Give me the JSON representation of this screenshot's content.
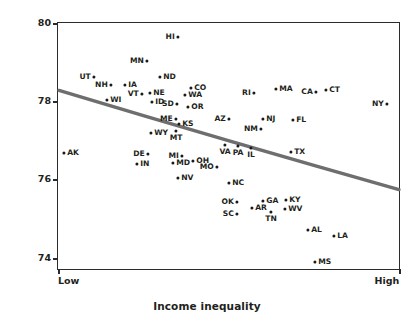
{
  "chart_data": {
    "type": "scatter",
    "title": "",
    "xlabel": "Income inequality",
    "ylabel": "Life expectancy (years)",
    "x_tick_labels": [
      "Low",
      "High"
    ],
    "y_tick_labels": [
      "74",
      "76",
      "78",
      "80"
    ],
    "ylim": [
      73.4,
      80.2
    ],
    "grid": false,
    "legend": "none",
    "point_color": "#1a1a1a",
    "trend_line_color": "#6e6e6e",
    "trend_line": {
      "description": "downward sloping fitted trend line from low-inequality/high-life-expectancy to high-inequality/low-life-expectancy",
      "x_start_px": 58,
      "y_start_px": 90,
      "x_end_px": 400,
      "y_end_px": 190,
      "control_x_px": 230,
      "control_y_px": 142
    },
    "points": [
      {
        "label": "HI",
        "px": 177,
        "py": 36,
        "life_expectancy": 79.65,
        "label_side": "left"
      },
      {
        "label": "MN",
        "px": 146,
        "py": 60,
        "life_expectancy": 79.05,
        "label_side": "left"
      },
      {
        "label": "UT",
        "px": 93,
        "py": 76,
        "life_expectancy": 78.65,
        "label_side": "left"
      },
      {
        "label": "ND",
        "px": 159,
        "py": 76,
        "life_expectancy": 78.65,
        "label_side": "right"
      },
      {
        "label": "NH",
        "px": 110,
        "py": 84,
        "life_expectancy": 78.45,
        "label_side": "left"
      },
      {
        "label": "IA",
        "px": 124,
        "py": 84,
        "life_expectancy": 78.45,
        "label_side": "right"
      },
      {
        "label": "CO",
        "px": 190,
        "py": 87,
        "life_expectancy": 78.37,
        "label_side": "right"
      },
      {
        "label": "MA",
        "px": 275,
        "py": 88,
        "life_expectancy": 78.35,
        "label_side": "right"
      },
      {
        "label": "CA",
        "px": 315,
        "py": 91,
        "life_expectancy": 78.27,
        "label_side": "left"
      },
      {
        "label": "CT",
        "px": 325,
        "py": 89,
        "life_expectancy": 78.32,
        "label_side": "right"
      },
      {
        "label": "VT",
        "px": 141,
        "py": 93,
        "life_expectancy": 78.22,
        "label_side": "left"
      },
      {
        "label": "NE",
        "px": 149,
        "py": 92,
        "life_expectancy": 78.25,
        "label_side": "right"
      },
      {
        "label": "WA",
        "px": 184,
        "py": 94,
        "life_expectancy": 78.2,
        "label_side": "right"
      },
      {
        "label": "RI",
        "px": 253,
        "py": 92,
        "life_expectancy": 78.25,
        "label_side": "left"
      },
      {
        "label": "WI",
        "px": 106,
        "py": 99,
        "life_expectancy": 78.07,
        "label_side": "right"
      },
      {
        "label": "ID",
        "px": 151,
        "py": 101,
        "life_expectancy": 78.02,
        "label_side": "right"
      },
      {
        "label": "SD",
        "px": 176,
        "py": 103,
        "life_expectancy": 77.97,
        "label_side": "left"
      },
      {
        "label": "NY",
        "px": 386,
        "py": 103,
        "life_expectancy": 77.97,
        "label_side": "left"
      },
      {
        "label": "OR",
        "px": 187,
        "py": 106,
        "life_expectancy": 77.9,
        "label_side": "right"
      },
      {
        "label": "ME",
        "px": 175,
        "py": 118,
        "life_expectancy": 77.6,
        "label_side": "left"
      },
      {
        "label": "AZ",
        "px": 228,
        "py": 118,
        "life_expectancy": 77.6,
        "label_side": "left"
      },
      {
        "label": "NJ",
        "px": 262,
        "py": 118,
        "life_expectancy": 77.6,
        "label_side": "right"
      },
      {
        "label": "FL",
        "px": 292,
        "py": 119,
        "life_expectancy": 77.57,
        "label_side": "right"
      },
      {
        "label": "KS",
        "px": 178,
        "py": 123,
        "life_expectancy": 77.48,
        "label_side": "right"
      },
      {
        "label": "NM",
        "px": 260,
        "py": 128,
        "life_expectancy": 77.35,
        "label_side": "left"
      },
      {
        "label": "WY",
        "px": 150,
        "py": 132,
        "life_expectancy": 77.25,
        "label_side": "right"
      },
      {
        "label": "MT",
        "px": 175,
        "py": 130,
        "life_expectancy": 77.3,
        "label_side": "below"
      },
      {
        "label": "VA",
        "px": 224,
        "py": 144,
        "life_expectancy": 76.95,
        "label_side": "below"
      },
      {
        "label": "PA",
        "px": 237,
        "py": 145,
        "life_expectancy": 76.92,
        "label_side": "below"
      },
      {
        "label": "IL",
        "px": 250,
        "py": 147,
        "life_expectancy": 76.87,
        "label_side": "below"
      },
      {
        "label": "TX",
        "px": 290,
        "py": 151,
        "life_expectancy": 76.77,
        "label_side": "right"
      },
      {
        "label": "AK",
        "px": 63,
        "py": 152,
        "life_expectancy": 76.75,
        "label_side": "right"
      },
      {
        "label": "DE",
        "px": 147,
        "py": 153,
        "life_expectancy": 76.72,
        "label_side": "left"
      },
      {
        "label": "MI",
        "px": 181,
        "py": 155,
        "life_expectancy": 76.67,
        "label_side": "left"
      },
      {
        "label": "OH",
        "px": 192,
        "py": 160,
        "life_expectancy": 76.55,
        "label_side": "right"
      },
      {
        "label": "IN",
        "px": 136,
        "py": 163,
        "life_expectancy": 76.48,
        "label_side": "right"
      },
      {
        "label": "MD",
        "px": 172,
        "py": 162,
        "life_expectancy": 76.5,
        "label_side": "right"
      },
      {
        "label": "MO",
        "px": 216,
        "py": 166,
        "life_expectancy": 76.4,
        "label_side": "left"
      },
      {
        "label": "NV",
        "px": 177,
        "py": 177,
        "life_expectancy": 76.12,
        "label_side": "right"
      },
      {
        "label": "NC",
        "px": 228,
        "py": 182,
        "life_expectancy": 76.0,
        "label_side": "right"
      },
      {
        "label": "OK",
        "px": 236,
        "py": 201,
        "life_expectancy": 75.53,
        "label_side": "left"
      },
      {
        "label": "GA",
        "px": 262,
        "py": 200,
        "life_expectancy": 75.55,
        "label_side": "right"
      },
      {
        "label": "KY",
        "px": 285,
        "py": 199,
        "life_expectancy": 75.58,
        "label_side": "right"
      },
      {
        "label": "AR",
        "px": 251,
        "py": 207,
        "life_expectancy": 75.38,
        "label_side": "right"
      },
      {
        "label": "WV",
        "px": 284,
        "py": 208,
        "life_expectancy": 75.35,
        "label_side": "right"
      },
      {
        "label": "SC",
        "px": 236,
        "py": 213,
        "life_expectancy": 75.23,
        "label_side": "left"
      },
      {
        "label": "TN",
        "px": 270,
        "py": 211,
        "life_expectancy": 75.28,
        "label_side": "below"
      },
      {
        "label": "AL",
        "px": 307,
        "py": 229,
        "life_expectancy": 74.83,
        "label_side": "right"
      },
      {
        "label": "LA",
        "px": 333,
        "py": 235,
        "life_expectancy": 74.68,
        "label_side": "right"
      },
      {
        "label": "MS",
        "px": 314,
        "py": 261,
        "life_expectancy": 74.03,
        "label_side": "right"
      }
    ]
  },
  "axes": {
    "y_ticks": [
      {
        "label": "80",
        "py": 22
      },
      {
        "label": "78",
        "py": 100
      },
      {
        "label": "76",
        "py": 178
      },
      {
        "label": "74",
        "py": 257
      }
    ],
    "x_ticks": [
      {
        "label": "Low",
        "px": 57,
        "align": "start"
      },
      {
        "label": "High",
        "px": 400,
        "align": "end"
      }
    ]
  }
}
